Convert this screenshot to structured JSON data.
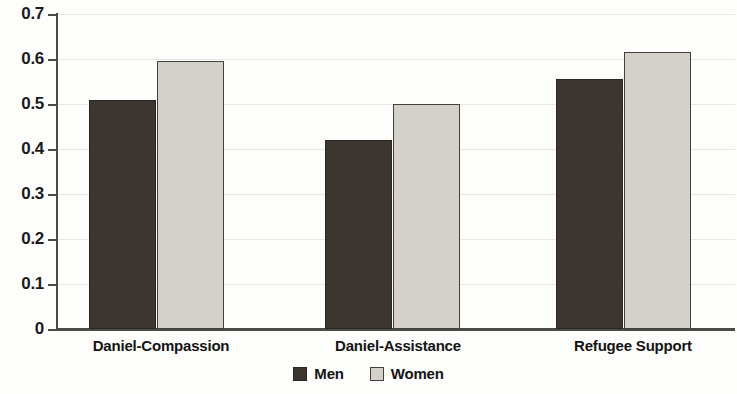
{
  "chart_data": {
    "type": "bar",
    "title": "",
    "subtitle": "",
    "xlabel": "",
    "ylabel": "",
    "categories": [
      "Daniel-Compassion",
      "Daniel-Assistance",
      "Refugee Support"
    ],
    "series": [
      {
        "name": "Men",
        "values": [
          0.51,
          0.42,
          0.555
        ],
        "color": "#3d352f"
      },
      {
        "name": "Women",
        "values": [
          0.595,
          0.5,
          0.615
        ],
        "color": "#d3d1ca"
      }
    ],
    "ylim": [
      0,
      0.7
    ],
    "ytick_labels": [
      "0.7",
      "0.6",
      "0.5",
      "0.4",
      "0.3",
      "0.2",
      "0.1",
      "0"
    ],
    "ytick_values": [
      0.7,
      0.6,
      0.5,
      0.4,
      0.3,
      0.2,
      0.1,
      0
    ],
    "grid": "horizontal",
    "legend_position": "bottom-center",
    "legend_entries": [
      "Men",
      "Women"
    ]
  }
}
